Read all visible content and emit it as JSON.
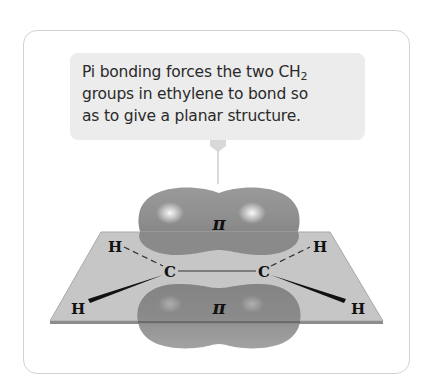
{
  "callout": {
    "line1_prefix": "Pi bonding forces the two CH",
    "line1_sub": "2",
    "line2": "groups in ethylene to bond so",
    "line3": "as to give a planar structure."
  },
  "molecule": {
    "name": "ethylene",
    "orbital_labels": {
      "top": "π",
      "bottom": "π"
    },
    "atoms": {
      "carbon_left": "C",
      "carbon_right": "C",
      "h_upper_left": "H",
      "h_lower_left": "H",
      "h_upper_right": "H",
      "h_lower_right": "H"
    }
  },
  "colors": {
    "frame_border": "#d2d2d2",
    "callout_bg": "#ececec",
    "plane_fill": "#c4c4c4",
    "plane_edge": "#8c8c8c",
    "lobe_fill": "#8e8e8e",
    "text": "#2a2a2a"
  }
}
